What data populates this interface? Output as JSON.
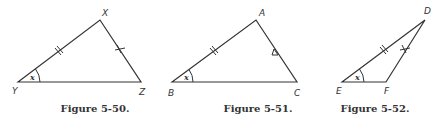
{
  "figures": [
    {
      "id": "fig-5-50",
      "caption": "Figure 5-50.",
      "vertices": {
        "top": "X",
        "left": "Y",
        "right": "Z"
      },
      "angle_label": "x",
      "marks": {
        "left_side": "double-tick",
        "right_side": "cross-tick"
      }
    },
    {
      "id": "fig-5-51",
      "caption": "Figure 5-51.",
      "vertices": {
        "top": "A",
        "left": "B",
        "right": "C"
      },
      "angle_label": "x",
      "marks": {
        "left_side": "double-tick",
        "right_side": "triangle-mark"
      }
    },
    {
      "id": "fig-5-52",
      "caption": "Figure 5-52.",
      "vertices": {
        "top": "D",
        "left": "E",
        "right": "F"
      },
      "angle_label": "x",
      "marks": {
        "left_side": "double-tick",
        "right_side": "cross-tick"
      }
    }
  ]
}
